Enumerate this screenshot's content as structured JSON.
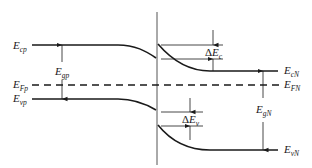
{
  "diagram": {
    "labels": {
      "E_cp": {
        "main": "E",
        "sub": "cp"
      },
      "E_Fp": {
        "main": "E",
        "sub": "Fp"
      },
      "E_vp": {
        "main": "E",
        "sub": "vp"
      },
      "E_gp": {
        "main": "E",
        "sub": "gp"
      },
      "delta_Ec": {
        "delta": "Δ",
        "main": "E",
        "sub": "c"
      },
      "delta_Ev": {
        "delta": "Δ",
        "main": "E",
        "sub": "v"
      },
      "E_cN": {
        "main": "E",
        "sub": "cN"
      },
      "E_FN": {
        "main": "E",
        "sub": "FN"
      },
      "E_gN": {
        "main": "E",
        "sub": "gN"
      },
      "E_vN": {
        "main": "E",
        "sub": "vN"
      }
    },
    "colors": {
      "line": "#1a1a1a",
      "interface": "#555555",
      "background": "#ffffff"
    }
  }
}
